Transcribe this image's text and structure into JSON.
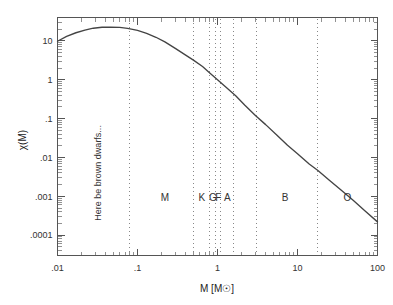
{
  "chart_data": {
    "type": "line",
    "title": "",
    "xlabel": "M [M☉]",
    "ylabel": "χ(M)",
    "xscale": "log",
    "yscale": "log",
    "xlim": [
      0.01,
      100
    ],
    "ylim": [
      3e-05,
      40
    ],
    "grid": false,
    "legend": null,
    "x_tick_labels": [
      ".01",
      ".1",
      "1",
      "10",
      "100"
    ],
    "x_tick_values": [
      0.01,
      0.1,
      1,
      10,
      100
    ],
    "y_tick_labels": [
      "10",
      "1",
      ".1",
      ".01",
      ".001",
      ".0001"
    ],
    "y_tick_values": [
      10,
      1,
      0.1,
      0.01,
      0.001,
      0.0001
    ],
    "series": [
      {
        "name": "χ(M)",
        "x": [
          0.01,
          0.013,
          0.017,
          0.022,
          0.028,
          0.036,
          0.046,
          0.06,
          0.075,
          0.09,
          0.1,
          0.13,
          0.17,
          0.22,
          0.3,
          0.4,
          0.5,
          0.65,
          0.8,
          1.0,
          1.3,
          1.7,
          2.2,
          3.0,
          4.0,
          5.5,
          7.5,
          10.0,
          14.0,
          18.0,
          25.0,
          35.0,
          50.0,
          70.0,
          100.0
        ],
        "y": [
          9.8,
          13.0,
          16.2,
          19.0,
          21.2,
          22.4,
          22.6,
          22.2,
          21.0,
          19.6,
          18.6,
          15.6,
          12.4,
          9.4,
          6.3,
          4.3,
          3.2,
          2.2,
          1.5,
          1.0,
          0.62,
          0.38,
          0.22,
          0.118,
          0.07,
          0.038,
          0.0205,
          0.0125,
          0.0068,
          0.0046,
          0.0026,
          0.00145,
          0.00078,
          0.00042,
          0.00022
        ]
      }
    ],
    "vertical_dividers": [
      {
        "value": 0.08,
        "label": ""
      },
      {
        "value": 0.5,
        "label": ""
      },
      {
        "value": 0.8,
        "label": ""
      },
      {
        "value": 0.95,
        "label": ""
      },
      {
        "value": 1.1,
        "label": ""
      },
      {
        "value": 1.6,
        "label": ""
      },
      {
        "value": 3.1,
        "label": ""
      },
      {
        "value": 18.0,
        "label": ""
      }
    ],
    "spectral_classes": [
      {
        "label": "M",
        "x": 0.22
      },
      {
        "label": "K",
        "x": 0.635
      },
      {
        "label": "G",
        "x": 0.873
      },
      {
        "label": "F",
        "x": 1.022
      },
      {
        "label": "A",
        "x": 1.33
      },
      {
        "label": "B",
        "x": 7.0
      },
      {
        "label": "O",
        "x": 42.0
      }
    ],
    "annotations": [
      {
        "text": "Here be brown dwarfs...",
        "x": 0.035,
        "y": 0.004,
        "rotation": -90
      }
    ]
  }
}
